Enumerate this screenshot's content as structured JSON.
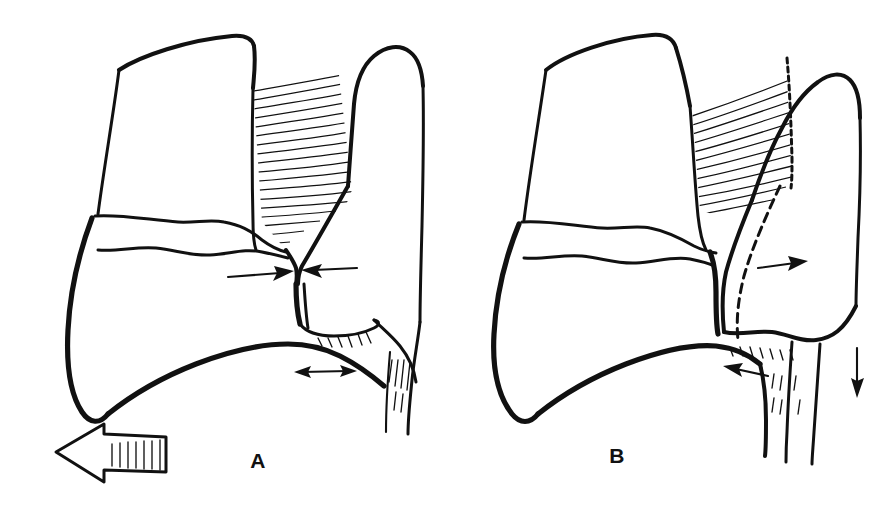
{
  "figure": {
    "background_color": "#ffffff",
    "ink_color": "#111111",
    "width": 894,
    "height": 507,
    "panel_count": 2
  },
  "panels": [
    {
      "id": "A",
      "label": "A",
      "label_x": 258,
      "label_y": 468,
      "description": "Tooth crown and adjacent tooth with interdental papilla; fibers hatched; converging horizontal arrows at contact point, double-headed arrow below, and large hollow block arrow at lower left.",
      "annotations": [
        {
          "name": "arrow-left-to-right-at-contact",
          "kind": "arrow",
          "direction": "right",
          "x1": 228,
          "y1": 277,
          "x2": 282,
          "y2": 273
        },
        {
          "name": "arrow-right-to-left-at-contact",
          "kind": "arrow",
          "direction": "left",
          "x1": 357,
          "y1": 268,
          "x2": 306,
          "y2": 270
        },
        {
          "name": "double-headed-arrow-gingival",
          "kind": "double-arrow",
          "direction": "horizontal",
          "x1": 297,
          "y1": 372,
          "x2": 352,
          "y2": 372
        },
        {
          "name": "block-arrow-movement-direction",
          "kind": "block-arrow",
          "direction": "left",
          "x": 38,
          "y": 424,
          "width": 128,
          "height": 58
        }
      ]
    },
    {
      "id": "B",
      "label": "B",
      "label_x": 617,
      "label_y": 463,
      "description": "Same teeth after movement; fibers stretched and obliquely hatched with dashed original outline; arrows showing displacement to the right, to the left, and downward.",
      "annotations": [
        {
          "name": "arrow-displacement-right",
          "kind": "arrow",
          "direction": "right",
          "x1": 758,
          "y1": 268,
          "x2": 806,
          "y2": 262
        },
        {
          "name": "arrow-displacement-left",
          "kind": "arrow",
          "direction": "left",
          "x1": 768,
          "y1": 376,
          "x2": 727,
          "y2": 366
        },
        {
          "name": "arrow-displacement-down",
          "kind": "arrow",
          "direction": "down",
          "x1": 858,
          "y1": 348,
          "x2": 857,
          "y2": 396
        },
        {
          "name": "dashed-original-outline",
          "kind": "dashed-line",
          "direction": "vertical-curved"
        }
      ]
    }
  ],
  "legend": {
    "visible": false,
    "items": []
  }
}
